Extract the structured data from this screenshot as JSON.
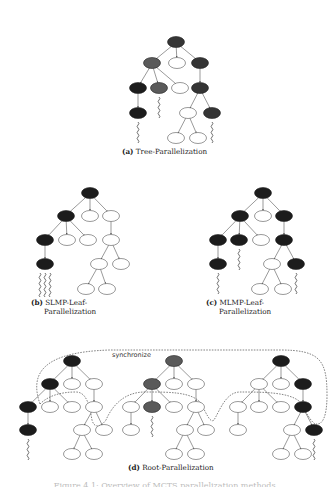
{
  "figure": {
    "panels": [
      {
        "id": "a",
        "label": "(a)",
        "title": "Tree-Parallelization"
      },
      {
        "id": "b",
        "label": "(b)",
        "title_line1": "SLMP-Leaf-",
        "title_line2": "Parallelization"
      },
      {
        "id": "c",
        "label": "(c)",
        "title_line1": "MLMP-Leaf-",
        "title_line2": "Parallelization"
      },
      {
        "id": "d",
        "label": "(d)",
        "title": "Root-Parallelization",
        "annotation": "synchronize"
      }
    ],
    "caption": "Figure 4.1: Overview of MCTS parallelization methods."
  },
  "colors": {
    "black_node": "#1c1c1c",
    "dark_node": "#353535",
    "gray_node": "#5a5a5a",
    "white_node": "#ffffff",
    "edge": "#555555"
  },
  "trees": {
    "a": {
      "nodes": [
        {
          "x": 176,
          "y": 42,
          "fill": "dark"
        },
        {
          "x": 152,
          "y": 63,
          "fill": "gray"
        },
        {
          "x": 177,
          "y": 63,
          "fill": "white"
        },
        {
          "x": 200,
          "y": 63,
          "fill": "dark"
        },
        {
          "x": 138,
          "y": 88,
          "fill": "black"
        },
        {
          "x": 159,
          "y": 88,
          "fill": "gray"
        },
        {
          "x": 180,
          "y": 88,
          "fill": "white"
        },
        {
          "x": 200,
          "y": 88,
          "fill": "dark"
        },
        {
          "x": 138,
          "y": 113,
          "fill": "black"
        },
        {
          "x": 188,
          "y": 113,
          "fill": "white"
        },
        {
          "x": 212,
          "y": 113,
          "fill": "dark"
        },
        {
          "x": 176,
          "y": 138,
          "fill": "white"
        },
        {
          "x": 198,
          "y": 138,
          "fill": "white"
        }
      ],
      "edges": [
        [
          0,
          1
        ],
        [
          0,
          2
        ],
        [
          0,
          3
        ],
        [
          1,
          4
        ],
        [
          1,
          5
        ],
        [
          1,
          6
        ],
        [
          3,
          7
        ],
        [
          4,
          8
        ],
        [
          7,
          9
        ],
        [
          7,
          10
        ],
        [
          9,
          11
        ],
        [
          9,
          12
        ]
      ],
      "rollouts": [
        {
          "x": 138,
          "y": 122,
          "n": 1
        },
        {
          "x": 159,
          "y": 97,
          "n": 1
        },
        {
          "x": 212,
          "y": 122,
          "n": 1
        }
      ]
    },
    "b": {
      "nodes": [
        {
          "x": 90,
          "y": 193,
          "fill": "black"
        },
        {
          "x": 66,
          "y": 216,
          "fill": "black"
        },
        {
          "x": 90,
          "y": 216,
          "fill": "white"
        },
        {
          "x": 111,
          "y": 216,
          "fill": "white"
        },
        {
          "x": 45,
          "y": 240,
          "fill": "black"
        },
        {
          "x": 67,
          "y": 240,
          "fill": "white"
        },
        {
          "x": 88,
          "y": 240,
          "fill": "white"
        },
        {
          "x": 111,
          "y": 240,
          "fill": "white"
        },
        {
          "x": 45,
          "y": 264,
          "fill": "black"
        },
        {
          "x": 99,
          "y": 264,
          "fill": "white"
        },
        {
          "x": 121,
          "y": 264,
          "fill": "white"
        },
        {
          "x": 86,
          "y": 289,
          "fill": "white"
        },
        {
          "x": 107,
          "y": 289,
          "fill": "white"
        }
      ],
      "edges": [
        [
          0,
          1
        ],
        [
          0,
          2
        ],
        [
          0,
          3
        ],
        [
          1,
          4
        ],
        [
          1,
          5
        ],
        [
          1,
          6
        ],
        [
          3,
          7
        ],
        [
          4,
          8
        ],
        [
          7,
          9
        ],
        [
          7,
          10
        ],
        [
          9,
          11
        ],
        [
          9,
          12
        ]
      ],
      "rollouts": [
        {
          "x": 45,
          "y": 273,
          "n": 3
        }
      ]
    },
    "c": {
      "nodes": [
        {
          "x": 263,
          "y": 193,
          "fill": "black"
        },
        {
          "x": 240,
          "y": 216,
          "fill": "black"
        },
        {
          "x": 263,
          "y": 216,
          "fill": "white"
        },
        {
          "x": 284,
          "y": 216,
          "fill": "black"
        },
        {
          "x": 218,
          "y": 240,
          "fill": "black"
        },
        {
          "x": 239,
          "y": 240,
          "fill": "black"
        },
        {
          "x": 261,
          "y": 240,
          "fill": "white"
        },
        {
          "x": 284,
          "y": 240,
          "fill": "black"
        },
        {
          "x": 218,
          "y": 264,
          "fill": "black"
        },
        {
          "x": 272,
          "y": 264,
          "fill": "white"
        },
        {
          "x": 296,
          "y": 264,
          "fill": "black"
        },
        {
          "x": 260,
          "y": 289,
          "fill": "white"
        },
        {
          "x": 283,
          "y": 289,
          "fill": "white"
        }
      ],
      "edges": [
        [
          0,
          1
        ],
        [
          0,
          2
        ],
        [
          0,
          3
        ],
        [
          1,
          4
        ],
        [
          1,
          5
        ],
        [
          1,
          6
        ],
        [
          3,
          7
        ],
        [
          4,
          8
        ],
        [
          7,
          9
        ],
        [
          7,
          10
        ],
        [
          9,
          11
        ],
        [
          9,
          12
        ]
      ],
      "rollouts": [
        {
          "x": 218,
          "y": 273,
          "n": 1
        },
        {
          "x": 239,
          "y": 249,
          "n": 1
        },
        {
          "x": 296,
          "y": 273,
          "n": 1
        }
      ]
    },
    "d1": {
      "nodes": [
        {
          "x": 72,
          "y": 361,
          "fill": "black"
        },
        {
          "x": 50,
          "y": 384,
          "fill": "black"
        },
        {
          "x": 72,
          "y": 384,
          "fill": "white"
        },
        {
          "x": 94,
          "y": 384,
          "fill": "white"
        },
        {
          "x": 28,
          "y": 407,
          "fill": "black"
        },
        {
          "x": 50,
          "y": 407,
          "fill": "white"
        },
        {
          "x": 72,
          "y": 407,
          "fill": "white"
        },
        {
          "x": 94,
          "y": 407,
          "fill": "white"
        },
        {
          "x": 28,
          "y": 430,
          "fill": "black"
        },
        {
          "x": 82,
          "y": 430,
          "fill": "white"
        },
        {
          "x": 104,
          "y": 430,
          "fill": "white"
        },
        {
          "x": 72,
          "y": 454,
          "fill": "white"
        },
        {
          "x": 94,
          "y": 454,
          "fill": "white"
        }
      ],
      "edges": [
        [
          0,
          1
        ],
        [
          0,
          2
        ],
        [
          0,
          3
        ],
        [
          1,
          4
        ],
        [
          1,
          5
        ],
        [
          1,
          6
        ],
        [
          3,
          7
        ],
        [
          4,
          8
        ],
        [
          7,
          9
        ],
        [
          7,
          10
        ],
        [
          9,
          11
        ],
        [
          9,
          12
        ]
      ],
      "rollouts": [
        {
          "x": 28,
          "y": 439,
          "n": 1
        }
      ]
    },
    "d2": {
      "nodes": [
        {
          "x": 174,
          "y": 361,
          "fill": "gray"
        },
        {
          "x": 152,
          "y": 384,
          "fill": "gray"
        },
        {
          "x": 174,
          "y": 384,
          "fill": "white"
        },
        {
          "x": 196,
          "y": 384,
          "fill": "white"
        },
        {
          "x": 131,
          "y": 407,
          "fill": "white"
        },
        {
          "x": 152,
          "y": 407,
          "fill": "gray"
        },
        {
          "x": 174,
          "y": 407,
          "fill": "white"
        },
        {
          "x": 196,
          "y": 407,
          "fill": "white"
        },
        {
          "x": 131,
          "y": 430,
          "fill": "white"
        },
        {
          "x": 185,
          "y": 430,
          "fill": "white"
        },
        {
          "x": 206,
          "y": 430,
          "fill": "white"
        },
        {
          "x": 174,
          "y": 454,
          "fill": "white"
        },
        {
          "x": 196,
          "y": 454,
          "fill": "white"
        }
      ],
      "edges": [
        [
          0,
          1
        ],
        [
          0,
          2
        ],
        [
          0,
          3
        ],
        [
          1,
          4
        ],
        [
          1,
          5
        ],
        [
          1,
          6
        ],
        [
          3,
          7
        ],
        [
          4,
          8
        ],
        [
          7,
          9
        ],
        [
          7,
          10
        ],
        [
          9,
          11
        ],
        [
          9,
          12
        ]
      ],
      "rollouts": [
        {
          "x": 152,
          "y": 416,
          "n": 1
        }
      ]
    },
    "d3": {
      "nodes": [
        {
          "x": 281,
          "y": 361,
          "fill": "black"
        },
        {
          "x": 259,
          "y": 384,
          "fill": "white"
        },
        {
          "x": 281,
          "y": 384,
          "fill": "white"
        },
        {
          "x": 303,
          "y": 384,
          "fill": "black"
        },
        {
          "x": 238,
          "y": 407,
          "fill": "white"
        },
        {
          "x": 259,
          "y": 407,
          "fill": "white"
        },
        {
          "x": 281,
          "y": 407,
          "fill": "white"
        },
        {
          "x": 303,
          "y": 407,
          "fill": "black"
        },
        {
          "x": 238,
          "y": 430,
          "fill": "white"
        },
        {
          "x": 292,
          "y": 430,
          "fill": "white"
        },
        {
          "x": 314,
          "y": 430,
          "fill": "black"
        },
        {
          "x": 281,
          "y": 454,
          "fill": "white"
        },
        {
          "x": 303,
          "y": 454,
          "fill": "white"
        }
      ],
      "edges": [
        [
          0,
          1
        ],
        [
          0,
          2
        ],
        [
          0,
          3
        ],
        [
          1,
          4
        ],
        [
          1,
          5
        ],
        [
          1,
          6
        ],
        [
          3,
          7
        ],
        [
          4,
          8
        ],
        [
          7,
          9
        ],
        [
          7,
          10
        ],
        [
          9,
          11
        ],
        [
          9,
          12
        ]
      ],
      "rollouts": [
        {
          "x": 314,
          "y": 439,
          "n": 1
        }
      ]
    }
  }
}
